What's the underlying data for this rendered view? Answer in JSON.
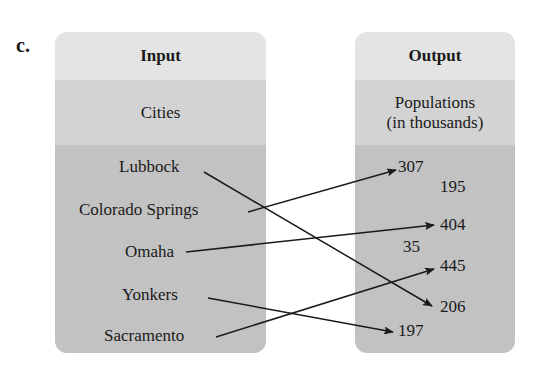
{
  "part_label": "c.",
  "input": {
    "header": "Input",
    "category": "Cities",
    "items": [
      "Lubbock",
      "Colorado Springs",
      "Omaha",
      "Yonkers",
      "Sacramento"
    ]
  },
  "output": {
    "header": "Output",
    "category_line1": "Populations",
    "category_line2": "(in thousands)",
    "items": [
      "307",
      "195",
      "404",
      "35",
      "445",
      "206",
      "197"
    ]
  },
  "mappings": [
    {
      "from": "Lubbock",
      "to": "206"
    },
    {
      "from": "Colorado Springs",
      "to": "307"
    },
    {
      "from": "Omaha",
      "to": "404"
    },
    {
      "from": "Yonkers",
      "to": "197"
    },
    {
      "from": "Sacramento",
      "to": "445"
    }
  ]
}
